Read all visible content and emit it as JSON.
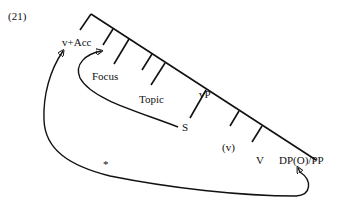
{
  "example_number": "(21)",
  "labels": {
    "v_acc": "v+Acc",
    "focus": "Focus",
    "topic": "Topic",
    "vp": "vP",
    "s": "S",
    "v_paren": "(v)",
    "v": "V",
    "dp_pp": "DP(O)/PP",
    "star": "*"
  },
  "colors": {
    "ink": "#111111",
    "background": "#ffffff"
  }
}
